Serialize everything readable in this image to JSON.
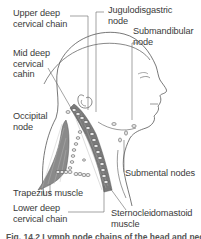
{
  "figure": {
    "type": "anatomical-illustration",
    "colors": {
      "line": "#555555",
      "muscle_fill": "#8a8a8a",
      "node_fill": "#e8e8e8",
      "text": "#3a3a3a",
      "background": "#ffffff"
    }
  },
  "labels": {
    "upper_deep_cervical_chain": "Upper deep\ncervical chain",
    "mid_deep_cervical_chain": "Mid deep\ncervical\ncahin",
    "occipital_node": "Occipital\nnode",
    "trapezius_muscle": "Trapezius muscle",
    "lower_deep_cervical_chain": "Lower deep\ncervical chain",
    "jugulodigastric_node": "Jugulodisgastric\nnode",
    "submandibular_node": "Submandibular\nnode",
    "submental_nodes": "Submental nodes",
    "sternocleidomastoid_muscle": "Sternocleidomastoid\nmuscle"
  },
  "caption": {
    "text": "Fig. 14.2 Lymph node chains of the head and neck"
  }
}
